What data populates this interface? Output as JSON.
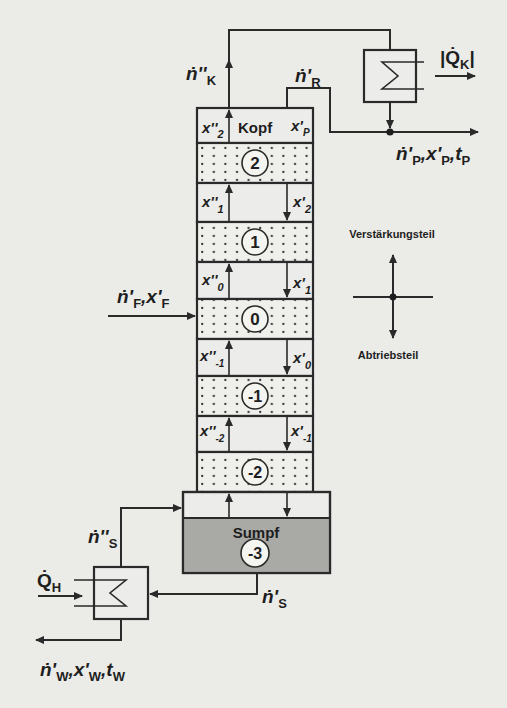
{
  "diagram": {
    "type": "distillation-column-schematic",
    "colors": {
      "line": "#2a2a2a",
      "background": "#ebebe8",
      "tray_fill": "#efefec",
      "sump_liquid": "#a9a9a6"
    },
    "column": {
      "head_label": "Kopf",
      "head_left_var": "x''",
      "head_left_sub": "2",
      "head_right_var": "x'",
      "head_right_sub": "P",
      "trays": [
        {
          "number": "2"
        },
        {
          "number": "1"
        },
        {
          "number": "0"
        },
        {
          "number": "-1"
        },
        {
          "number": "-2"
        }
      ],
      "gaps": [
        {
          "vapor_var": "x''",
          "vapor_sub": "1",
          "liquid_var": "x'",
          "liquid_sub": "2"
        },
        {
          "vapor_var": "x''",
          "vapor_sub": "0",
          "liquid_var": "x'",
          "liquid_sub": "1"
        },
        {
          "vapor_var": "x''",
          "vapor_sub": "-1",
          "liquid_var": "x'",
          "liquid_sub": "0"
        },
        {
          "vapor_var": "x''",
          "vapor_sub": "-2",
          "liquid_var": "x'",
          "liquid_sub": "-1"
        }
      ],
      "sump_label": "Sumpf",
      "sump_number": "-3"
    },
    "streams": {
      "vapor_top": {
        "symbol": "ṅ''",
        "sub": "K"
      },
      "reflux": {
        "symbol": "ṅ'",
        "sub": "R"
      },
      "condenser_duty": {
        "prefix": "|",
        "symbol": "Q̇",
        "sub": "K",
        "suffix": "|"
      },
      "distillate": {
        "n": "ṅ'",
        "n_sub": "P",
        "x": "x'",
        "x_sub": "P",
        "t": "t",
        "t_sub": "P"
      },
      "feed": {
        "n": "ṅ'",
        "n_sub": "F",
        "x": "x'",
        "x_sub": "F"
      },
      "boilup": {
        "symbol": "ṅ''",
        "sub": "S"
      },
      "sump_liquid": {
        "symbol": "ṅ'",
        "sub": "S"
      },
      "reboiler_duty": {
        "symbol": "Q̇",
        "sub": "H"
      },
      "bottoms": {
        "n": "ṅ'",
        "n_sub": "W",
        "x": "x'",
        "x_sub": "W",
        "t": "t",
        "t_sub": "W"
      }
    },
    "legend": {
      "up_label": "Verstärkungsteil",
      "down_label": "Abtriebsteil"
    }
  }
}
